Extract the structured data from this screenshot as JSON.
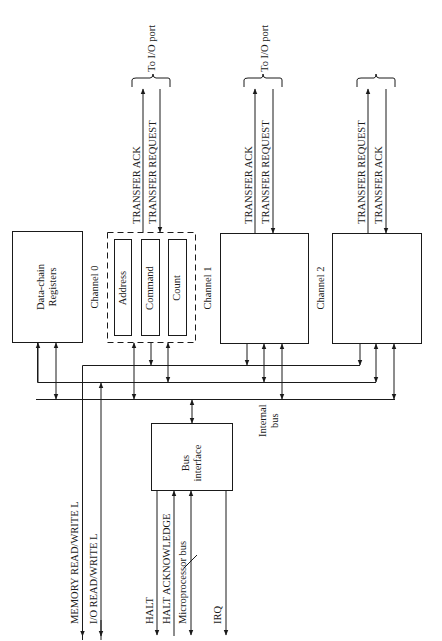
{
  "diagram": {
    "blocks": {
      "data_chain": {
        "label_line1": "Data-chain",
        "label_line2": "Registers"
      },
      "channel0": {
        "label": "Channel 0",
        "registers": [
          "Address",
          "Command",
          "Count"
        ]
      },
      "channel1": {
        "label": "Channel 1"
      },
      "channel2": {
        "label": "Channel 2"
      },
      "bus_interface": {
        "label_line1": "Bus",
        "label_line2": "interface"
      }
    },
    "io_port": {
      "label": "To I/O port",
      "channel0_signals": [
        "TRANSFER ACK",
        "TRANSFER REQUEST"
      ],
      "channel1_signals": [
        "TRANSFER ACK",
        "TRANSFER REQUEST"
      ],
      "channel2_signals": [
        "TRANSFER REQUEST",
        "TRANSFER ACK"
      ]
    },
    "internal_bus": {
      "label_line1": "Internal",
      "label_line2": "bus"
    },
    "external_signals": {
      "memory_rw": "MEMORY READ/WRITE L",
      "io_rw": "I/O READ/WRITE L",
      "halt": "HALT",
      "halt_ack": "HALT ACKNOWLEDGE",
      "microprocessor_bus": "Microprocessor bus",
      "irq": "IRQ"
    },
    "colors": {
      "line": "#1a1a1a",
      "background": "#ffffff"
    }
  }
}
